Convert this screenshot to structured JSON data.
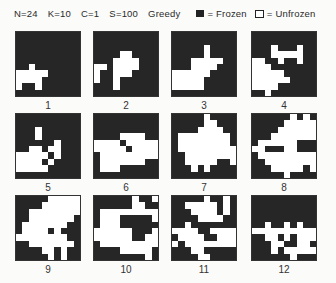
{
  "header": {
    "params": [
      "N=24",
      "K=10",
      "C=1",
      "S=100",
      "Greedy"
    ],
    "legend": [
      {
        "key": "frozen",
        "label": "= Frozen",
        "color": "#262626"
      },
      {
        "key": "unfrozen",
        "label": "= Unfrozen",
        "color": "#ffffff"
      }
    ]
  },
  "panels": [
    {
      "label": "1",
      "grid": [
        "1111111111",
        "1111111111",
        "1111111111",
        "1111111111",
        "1111111111",
        "1101111111",
        "0000011111",
        "0000111111",
        "0110111111",
        "1111111111"
      ]
    },
    {
      "label": "2",
      "grid": [
        "1111111111",
        "1111111111",
        "1111111111",
        "1111001111",
        "1110000111",
        "0010000111",
        "0110001111",
        "0110111111",
        "1110111111",
        "1111111111"
      ]
    },
    {
      "label": "3",
      "grid": [
        "1111111111",
        "1111111111",
        "1111101111",
        "1111101111",
        "1110000011",
        "1110000111",
        "0000001111",
        "0000011111",
        "0000011111",
        "1111111111"
      ]
    },
    {
      "label": "4",
      "grid": [
        "1111111111",
        "1111111111",
        "1110111011",
        "1110000011",
        "0011011011",
        "0001111111",
        "0000011111",
        "0000001111",
        "0000111111",
        "1101111111"
      ]
    },
    {
      "label": "5",
      "grid": [
        "1111111111",
        "1111111111",
        "1110111111",
        "1110111111",
        "1111110111",
        "1100100111",
        "0000010111",
        "0000101111",
        "0000011111",
        "1111111111"
      ]
    },
    {
      "label": "6",
      "grid": [
        "1111111111",
        "1111111111",
        "1111111111",
        "1111000011",
        "0000100000",
        "0000010000",
        "1000000000",
        "1000000011",
        "1000111111",
        "1111111111"
      ]
    },
    {
      "label": "7",
      "grid": [
        "1111101111",
        "1111100111",
        "1111000011",
        "1000000001",
        "1000000001",
        "1000000000",
        "1100000000",
        "1100000110",
        "1110101111",
        "1111111111"
      ]
    },
    {
      "label": "8",
      "grid": [
        "1111110101",
        "1111100000",
        "1111000000",
        "1110000000",
        "1000000111",
        "0011100111",
        "1000000000",
        "1100000000",
        "1110000010",
        "1111101111"
      ]
    },
    {
      "label": "9",
      "grid": [
        "1111100000",
        "1111000000",
        "1100000000",
        "1100000001",
        "1000000011",
        "1000010111",
        "0000000011",
        "1100000001",
        "1111001011",
        "1111101011"
      ]
    },
    {
      "label": "10",
      "grid": [
        "1111110110",
        "1111110011",
        "1000000000",
        "1000111110",
        "1000111111",
        "0000001110",
        "0000001100",
        "1000000000",
        "1111000001",
        "1111111101"
      ]
    },
    {
      "label": "11",
      "grid": [
        "1111101101",
        "1100000101",
        "1110000101",
        "1111000011",
        "1101111111",
        "0000110000",
        "1000011000",
        "0100000000",
        "1110011111",
        "1111001111"
      ]
    },
    {
      "label": "12",
      "grid": [
        "1111111111",
        "1111111111",
        "1111111111",
        "1111111111",
        "1101101011",
        "0000000000",
        "1100101000",
        "1110011001",
        "1110100000",
        "1111110111"
      ]
    }
  ]
}
